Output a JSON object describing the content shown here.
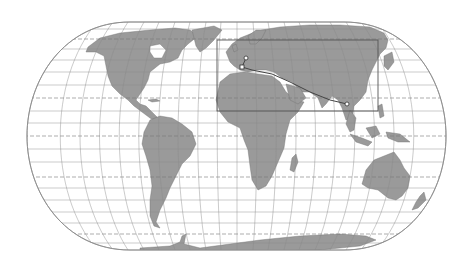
{
  "map": {
    "type": "world-map",
    "projection": "Eckert IV (pseudocylindrical)",
    "colors": {
      "background": "#ffffff",
      "ocean": "#ffffff",
      "land": "#9a9a9a",
      "coastline": "#6a6a6a",
      "graticule": "#8a8a8a",
      "special_parallels": "#777777",
      "highlight_box": "#555555",
      "route": "#444444"
    },
    "graticule": {
      "parallels_spacing_deg": 10,
      "meridians_spacing_deg": 15,
      "dashed_lines": [
        "Arctic Circle",
        "Tropic of Cancer",
        "Equator",
        "Tropic of Capricorn",
        "Antarctic Circle"
      ]
    },
    "highlight_box": {
      "label": "region-of-interest",
      "region": "Europe / North Africa / Asia"
    },
    "route": {
      "points": [
        {
          "name": "route-start",
          "shape": "circle",
          "region": "Western Europe"
        },
        {
          "name": "route-waypoint",
          "shape": "square",
          "region": "Western Mediterranean"
        },
        {
          "name": "route-end",
          "shape": "circle",
          "region": "Southeast Asia"
        }
      ]
    }
  }
}
